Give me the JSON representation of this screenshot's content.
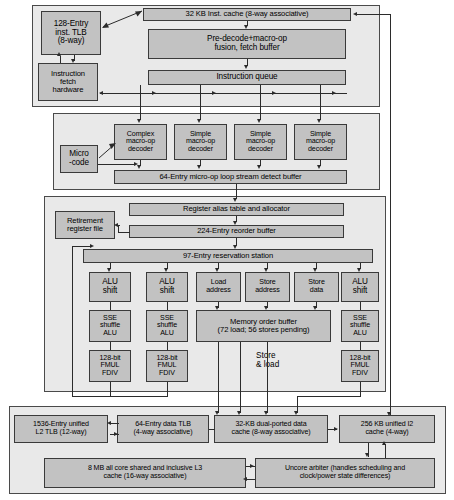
{
  "diagram": {
    "colors": {
      "panel_fill": "#e9e9e9",
      "box_fill": "#c2c2c2",
      "line": "#2b2b2b",
      "border": "#3a3a3a",
      "background": "#ffffff"
    }
  },
  "front_end": {
    "inst_tlb": "128-Entry\ninst. TLB\n(8-way)",
    "fetch_hardware": "Instruction\nfetch\nhardware",
    "inst_cache": "32 KB Inst. cache (8-way associative)",
    "predecode": "Pre-decode+macro-op\nfusion, fetch buffer",
    "instruction_queue": "Instruction queue"
  },
  "decode": {
    "microcode": "Micro\n-code",
    "decoders": [
      "Complex\nmacro-op\ndecoder",
      "Simple\nmacro-op\ndecoder",
      "Simple\nmacro-op\ndecoder",
      "Simple\nmacro-op\ndecoder"
    ],
    "loop_buffer": "64-Entry micro-op loop stream detect buffer"
  },
  "rename_dispatch": {
    "retirement_register_file": "Retirement\nregister file",
    "register_alias_table": "Register alias table and allocator",
    "reorder_buffer": "224-Entry reorder buffer",
    "reservation_station": "97-Entry reservation station"
  },
  "execution": {
    "columns": [
      {
        "top": "ALU\nshift",
        "mid": "SSE\nshuffle\nALU",
        "bottom": "128-bit\nFMUL\nFDIV"
      },
      {
        "top": "ALU\nshift",
        "mid": "SSE\nshuffle\nALU",
        "bottom": "128-bit\nFMUL\nFDIV"
      },
      {
        "top": "Load\naddress"
      },
      {
        "top": "Store\naddress"
      },
      {
        "top": "Store\ndata"
      },
      {
        "top": "ALU\nshift",
        "mid": "SSE\nshuffle\nALU",
        "bottom": "128-bit\nFMUL\nFDIV"
      }
    ],
    "memory_order_buffer": "Memory order buffer\n(72 load; 56 stores pending)",
    "store_load_label": "Store\n& load"
  },
  "memory_hierarchy": {
    "l2_tlb": "1536-Entry unified\nL2 TLB (12-way)",
    "data_tlb": "64-Entry data TLB\n(4-way associative)",
    "data_cache": "32-KB dual-ported data\ncache (8-way associative)",
    "l2_cache": "256 KB unified I2\ncache (4-way)",
    "l3_cache": "8 MB all core shared and inclusive L3\ncache (16-way associative)",
    "uncore_arbiter": "Uncore arbiter (handles scheduling and\nclock/power state differences)"
  }
}
